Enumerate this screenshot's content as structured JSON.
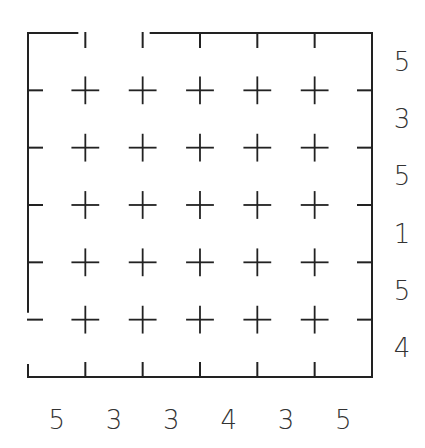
{
  "puzzle": {
    "type": "grid-maze-clue-puzzle",
    "rows": 6,
    "cols": 6,
    "grid": {
      "left": 28,
      "top": 33,
      "cell": 57.33
    },
    "stroke_color": "#222222",
    "clue_color": "#333333",
    "openings": [
      {
        "side": "top",
        "index": 1,
        "label": "entrance"
      },
      {
        "side": "left",
        "index": 5,
        "label": "exit"
      }
    ],
    "right_clues": [
      "5",
      "3",
      "5",
      "1",
      "5",
      "4"
    ],
    "bottom_clues": [
      "5",
      "3",
      "3",
      "4",
      "3",
      "5"
    ]
  }
}
